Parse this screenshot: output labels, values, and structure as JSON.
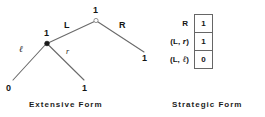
{
  "figure": {
    "left_caption": "Extensive  Form",
    "right_caption": "Strategic  Form"
  },
  "extensive_form": {
    "root": {
      "owner_label": "1",
      "node_style": "hollow"
    },
    "root_actions": {
      "left": "L",
      "right": "R"
    },
    "inner_node": {
      "owner_label": "1",
      "node_style": "filled"
    },
    "inner_actions": {
      "left": "ℓ",
      "right": "r"
    },
    "payoffs": {
      "inner_left": "0",
      "inner_right": "1",
      "root_right": "1"
    }
  },
  "strategic_form": {
    "rows": [
      {
        "strategy": "R",
        "strategy_prefix": "R",
        "strategy_italic": "",
        "strategy_suffix": "",
        "value": "1"
      },
      {
        "strategy": "(L, r)",
        "strategy_prefix": "(L, ",
        "strategy_italic": "r",
        "strategy_suffix": ")",
        "value": "1"
      },
      {
        "strategy": "(L, ℓ)",
        "strategy_prefix": "(L, ",
        "strategy_italic": "ℓ",
        "strategy_suffix": ")",
        "value": "0"
      }
    ]
  },
  "colors": {
    "ink": "#141414",
    "line": "#6a6a6a",
    "border": "#666666",
    "background": "#ffffff"
  }
}
